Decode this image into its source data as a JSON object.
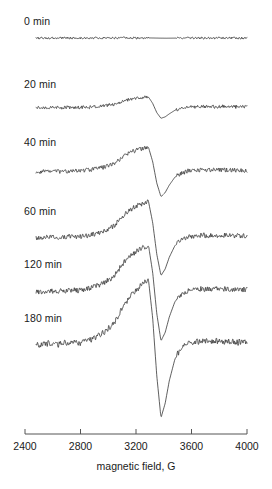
{
  "chart_data": {
    "type": "line",
    "title": "",
    "subtitle": "",
    "xlabel": "magnetic field, G",
    "ylabel": "",
    "xlim": [
      2400,
      4000
    ],
    "xticks": [
      2400,
      2800,
      3200,
      3600,
      4000
    ],
    "xticklabels": [
      "2400",
      "2800",
      "3200",
      "3600",
      "4000"
    ],
    "grid": false,
    "legend": "none",
    "stacked_offset_traces": true,
    "annotations": [
      "0 min",
      "20 min",
      "40 min",
      "60 min",
      "120 min",
      "180 min"
    ],
    "series": [
      {
        "name": "0 min",
        "label": "0 min",
        "baseline_y_px": 38,
        "amplitude_rel": 0.05,
        "x": [
          2480,
          2560,
          2640,
          2720,
          2800,
          2880,
          2960,
          3040,
          3120,
          3200,
          3260,
          3300,
          3340,
          3380,
          3420,
          3470,
          3520,
          3600,
          3700,
          3800,
          3900,
          4000
        ],
        "values": [
          0.0,
          0.01,
          0.0,
          0.01,
          0.0,
          0.01,
          0.02,
          0.01,
          0.02,
          0.03,
          0.03,
          0.02,
          -0.02,
          -0.06,
          -0.08,
          -0.05,
          -0.02,
          0.0,
          0.0,
          0.0,
          0.0,
          0.0
        ]
      },
      {
        "name": "20 min",
        "label": "20 min",
        "baseline_y_px": 108,
        "amplitude_rel": 0.45,
        "x": [
          2480,
          2560,
          2640,
          2720,
          2800,
          2880,
          2960,
          3040,
          3110,
          3180,
          3240,
          3290,
          3320,
          3350,
          3380,
          3410,
          3440,
          3480,
          3520,
          3580,
          3660,
          3740,
          3820,
          3900,
          4000
        ],
        "values": [
          0.0,
          0.02,
          0.01,
          0.03,
          0.02,
          0.05,
          0.09,
          0.16,
          0.3,
          0.4,
          0.44,
          0.47,
          0.2,
          -0.2,
          -0.44,
          -0.38,
          -0.25,
          -0.1,
          -0.02,
          0.04,
          0.06,
          0.05,
          0.07,
          0.05,
          0.04
        ]
      },
      {
        "name": "40 min",
        "label": "40 min",
        "baseline_y_px": 172,
        "amplitude_rel": 0.72,
        "x": [
          2480,
          2560,
          2640,
          2720,
          2800,
          2880,
          2960,
          3040,
          3110,
          3180,
          3240,
          3290,
          3320,
          3350,
          3380,
          3410,
          3440,
          3480,
          3520,
          3580,
          3660,
          3740,
          3820,
          3900,
          4000
        ],
        "values": [
          0.0,
          0.02,
          0.01,
          0.03,
          0.03,
          0.06,
          0.12,
          0.22,
          0.42,
          0.56,
          0.62,
          0.66,
          0.28,
          -0.3,
          -0.66,
          -0.55,
          -0.35,
          -0.14,
          -0.04,
          0.03,
          0.06,
          0.05,
          0.06,
          0.05,
          0.04
        ]
      },
      {
        "name": "60 min",
        "label": "60 min",
        "baseline_y_px": 238,
        "amplitude_rel": 0.88,
        "x": [
          2480,
          2560,
          2640,
          2720,
          2800,
          2880,
          2960,
          3040,
          3110,
          3180,
          3240,
          3290,
          3320,
          3350,
          3380,
          3410,
          3440,
          3480,
          3520,
          3580,
          3660,
          3740,
          3820,
          3900,
          4000
        ],
        "values": [
          0.0,
          0.02,
          0.01,
          0.04,
          0.03,
          0.07,
          0.14,
          0.26,
          0.5,
          0.66,
          0.74,
          0.8,
          0.34,
          -0.36,
          -0.82,
          -0.68,
          -0.42,
          -0.17,
          -0.05,
          0.03,
          0.06,
          0.05,
          0.06,
          0.05,
          0.04
        ]
      },
      {
        "name": "120 min",
        "label": "120 min",
        "baseline_y_px": 292,
        "amplitude_rel": 1.0,
        "x": [
          2480,
          2560,
          2640,
          2720,
          2800,
          2880,
          2960,
          3040,
          3110,
          3180,
          3240,
          3290,
          3320,
          3350,
          3380,
          3410,
          3440,
          3480,
          3520,
          3580,
          3660,
          3740,
          3820,
          3900,
          4000
        ],
        "values": [
          0.0,
          0.02,
          0.01,
          0.04,
          0.03,
          0.08,
          0.16,
          0.3,
          0.56,
          0.74,
          0.84,
          0.9,
          0.38,
          -0.42,
          -0.94,
          -0.78,
          -0.48,
          -0.19,
          -0.05,
          0.03,
          0.06,
          0.05,
          0.06,
          0.05,
          0.04
        ]
      },
      {
        "name": "180 min",
        "label": "180 min",
        "baseline_y_px": 345,
        "amplitude_rel": 1.25,
        "x": [
          2480,
          2560,
          2640,
          2720,
          2800,
          2880,
          2960,
          3040,
          3110,
          3180,
          3240,
          3290,
          3320,
          3350,
          3380,
          3410,
          3440,
          3480,
          3520,
          3580,
          3660,
          3740,
          3820,
          3900,
          4000
        ],
        "values": [
          0.0,
          0.02,
          0.01,
          0.04,
          0.03,
          0.09,
          0.18,
          0.33,
          0.6,
          0.8,
          0.92,
          1.0,
          0.42,
          -0.48,
          -1.12,
          -0.9,
          -0.55,
          -0.22,
          -0.06,
          0.03,
          0.06,
          0.05,
          0.06,
          0.05,
          0.04
        ]
      }
    ],
    "colors": {
      "trace": "#1a1a1a",
      "axis": "#555555",
      "text": "#1a1a1a"
    }
  },
  "axis": {
    "title": "magnetic field, G",
    "ticks": [
      {
        "value": 2400,
        "label": "2400"
      },
      {
        "value": 2800,
        "label": "2800"
      },
      {
        "value": 3200,
        "label": "3200"
      },
      {
        "value": 3600,
        "label": "3600"
      },
      {
        "value": 4000,
        "label": "4000"
      }
    ]
  },
  "labels": {
    "t0": "0 min",
    "t20": "20 min",
    "t40": "40 min",
    "t60": "60 min",
    "t120": "120 min",
    "t180": "180 min"
  }
}
